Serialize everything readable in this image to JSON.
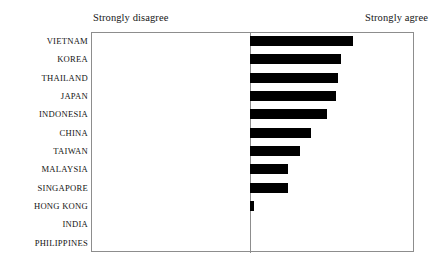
{
  "chart_data": {
    "type": "bar",
    "orientation": "horizontal",
    "title": "",
    "subtitle": "",
    "xlabel": "",
    "ylabel": "",
    "grid": false,
    "legend": null,
    "axis_captions": {
      "left": "Strongly disagree",
      "right": "Strongly agree"
    },
    "xlim": [
      0,
      100
    ],
    "categories": [
      "VIETNAM",
      "KOREA",
      "THAILAND",
      "JAPAN",
      "INDONESIA",
      "CHINA",
      "TAIWAN",
      "MALAYSIA",
      "SINGAPORE",
      "HONG KONG",
      "INDIA",
      "PHILIPPINES"
    ],
    "values": [
      100,
      88,
      85,
      83,
      74,
      59,
      48,
      37,
      37,
      4,
      0,
      0
    ],
    "bar_color": "#000000",
    "frame_color": "#8d8d8d",
    "background": "#ffffff"
  },
  "rows": [
    {
      "label": "VIETNAM",
      "value": 100,
      "bar_px": 103
    },
    {
      "label": "KOREA",
      "value": 88,
      "bar_px": 91
    },
    {
      "label": "THAILAND",
      "value": 85,
      "bar_px": 88
    },
    {
      "label": "JAPAN",
      "value": 83,
      "bar_px": 86
    },
    {
      "label": "INDONESIA",
      "value": 74,
      "bar_px": 77
    },
    {
      "label": "CHINA",
      "value": 59,
      "bar_px": 61
    },
    {
      "label": "TAIWAN",
      "value": 48,
      "bar_px": 50
    },
    {
      "label": "MALAYSIA",
      "value": 37,
      "bar_px": 38
    },
    {
      "label": "SINGAPORE",
      "value": 37,
      "bar_px": 38
    },
    {
      "label": "HONG KONG",
      "value": 4,
      "bar_px": 4
    },
    {
      "label": "INDIA",
      "value": 0,
      "bar_px": 0
    },
    {
      "label": "PHILIPPINES",
      "value": 0,
      "bar_px": 0
    }
  ]
}
